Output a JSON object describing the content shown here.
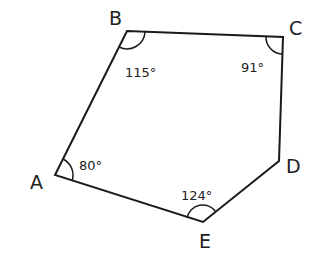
{
  "diagram": {
    "type": "pentagon",
    "stroke_color": "#1a1a1a",
    "vertices": [
      {
        "name": "A",
        "x": 55,
        "y": 175,
        "label_x": 30,
        "label_y": 189
      },
      {
        "name": "B",
        "x": 127,
        "y": 31,
        "label_x": 109,
        "label_y": 25
      },
      {
        "name": "C",
        "x": 283,
        "y": 37,
        "label_x": 289,
        "label_y": 35
      },
      {
        "name": "D",
        "x": 279,
        "y": 161,
        "label_x": 286,
        "label_y": 173
      },
      {
        "name": "E",
        "x": 203,
        "y": 222,
        "label_x": 199,
        "label_y": 248
      }
    ],
    "angles": [
      {
        "vertex": "A",
        "value": "80°",
        "label_x": 79,
        "label_y": 170
      },
      {
        "vertex": "B",
        "value": "115°",
        "label_x": 125,
        "label_y": 77
      },
      {
        "vertex": "C",
        "value": "91°",
        "label_x": 241,
        "label_y": 72
      },
      {
        "vertex": "E",
        "value": "124°",
        "label_x": 181,
        "label_y": 200
      }
    ]
  }
}
